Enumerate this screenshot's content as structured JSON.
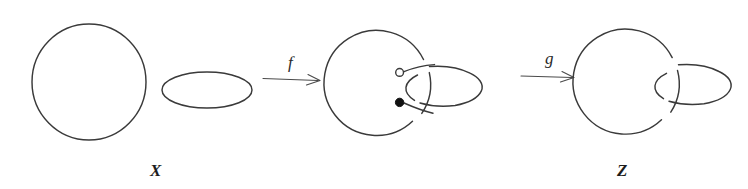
{
  "figure": {
    "kind": "topology-link-diagram",
    "background_color": "#ffffff",
    "line_color": "#3a3a3a",
    "objects": [
      {
        "id": "X",
        "label": "X",
        "label_x": 155,
        "label_y": 170,
        "components": "two disjoint unknotted circles",
        "component_count": 2
      },
      {
        "id": "Y",
        "label": "",
        "components": "circle with a broken arc and an ellipse, two basepoints marked",
        "component_count": 2,
        "markers": [
          {
            "type": "hollow-dot",
            "x": 400,
            "y": 73,
            "radius": 4
          },
          {
            "type": "filled-dot",
            "x": 400,
            "y": 102,
            "radius": 4
          }
        ]
      },
      {
        "id": "Z",
        "label": "Z",
        "label_x": 622,
        "label_y": 170,
        "components": "Hopf link: circle and ellipse interlocked",
        "component_count": 2
      }
    ],
    "maps": [
      {
        "id": "f",
        "label": "f",
        "from": "X",
        "to": "Y",
        "label_x": 293,
        "label_y": 62,
        "arrow_x1": 263,
        "arrow_x2": 320,
        "arrow_y": 79
      },
      {
        "id": "g",
        "label": "g",
        "from": "Y",
        "to": "Z",
        "label_x": 550,
        "label_y": 58,
        "arrow_x1": 521,
        "arrow_x2": 575,
        "arrow_y": 76
      }
    ]
  }
}
